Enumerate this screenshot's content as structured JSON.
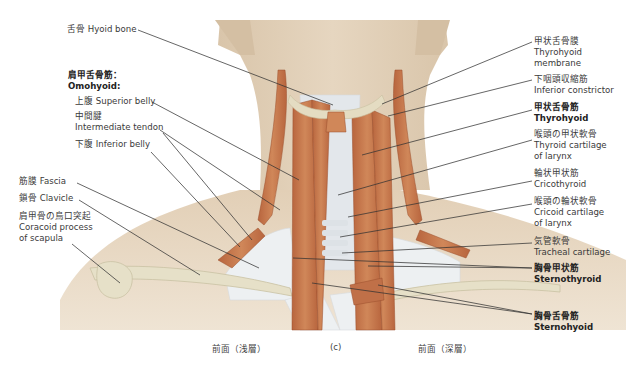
{
  "figure": {
    "panel": "(c)",
    "captions": {
      "left": "前面（浅層）",
      "center": "(c)",
      "right": "前面（深層）"
    },
    "colors": {
      "skin": "#e4d3bd",
      "skin_shadow": "#d3bea3",
      "muscle": "#c8774d",
      "muscle_dark": "#a85a35",
      "fascia": "#eef1f3",
      "bone": "#e2dcc4",
      "leader_line": "#333333"
    },
    "left_labels": {
      "hyoid": {
        "jp": "舌骨",
        "en": "Hyoid bone"
      },
      "omohyoid_title": {
        "jp": "肩甲舌骨筋：",
        "en": "Omohyoid:"
      },
      "superior_belly": {
        "jp": "上腹",
        "en": "Superior belly"
      },
      "intermediate_tendon": {
        "jp": "中間腱",
        "en": "Intermediate tendon"
      },
      "inferior_belly": {
        "jp": "下腹",
        "en": "Inferior belly"
      },
      "fascia": {
        "jp": "筋膜",
        "en": "Fascia"
      },
      "clavicle": {
        "jp": "鎖骨",
        "en": "Clavicle"
      },
      "coracoid": {
        "jp": "肩甲骨の烏口突起",
        "en1": "Coracoid process",
        "en2": "of scapula"
      }
    },
    "right_labels": {
      "thyrohyoid_membrane": {
        "jp": "甲状舌骨膜",
        "en1": "Thyrohyoid",
        "en2": "membrane"
      },
      "inferior_constrictor": {
        "jp": "下咽頭収縮筋",
        "en": "Inferior constrictor"
      },
      "thyrohyoid": {
        "jp": "甲状舌骨筋",
        "en": "Thyrohyoid"
      },
      "thyroid_cartilage": {
        "jp": "喉頭の甲状軟骨",
        "en1": "Thyroid cartilage",
        "en2": "of larynx"
      },
      "cricothyroid": {
        "jp": "輪状甲状筋",
        "en": "Cricothyroid"
      },
      "cricoid_cartilage": {
        "jp": "喉頭の輪状軟骨",
        "en1": "Cricoid cartilage",
        "en2": "of larynx"
      },
      "tracheal_cartilage": {
        "jp": "気管軟骨",
        "en": "Tracheal cartilage"
      },
      "sternothyroid": {
        "jp": "胸骨甲状筋",
        "en": "Sternothyroid"
      },
      "sternohyoid": {
        "jp": "胸骨舌骨筋",
        "en": "Sternohyoid"
      }
    }
  }
}
